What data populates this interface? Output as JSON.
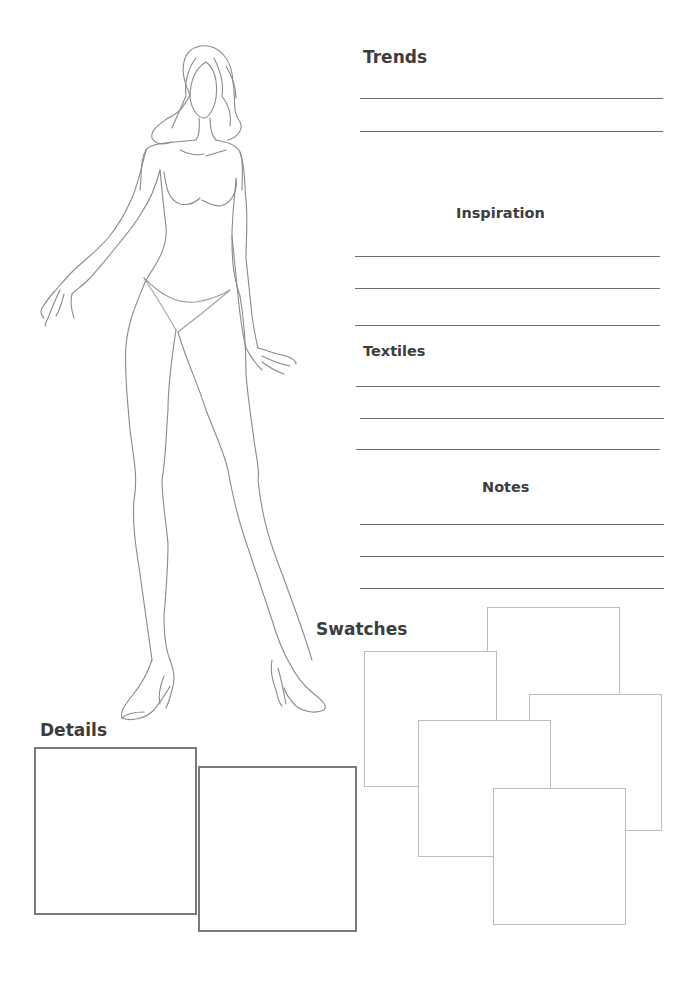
{
  "page": {
    "type": "fashion design sketch worksheet",
    "background": "#ffffff"
  },
  "figure": {
    "label": "fashion croquis figure outline",
    "stroke_color": "#8a8a8c"
  },
  "sections": {
    "trends": {
      "title": "Trends",
      "line_count": 2
    },
    "inspiration": {
      "title": "Inspiration",
      "line_count": 3
    },
    "textiles": {
      "title": "Textiles",
      "line_count": 3
    },
    "notes": {
      "title": "Notes",
      "line_count": 3
    },
    "swatches": {
      "title": "Swatches",
      "box_count": 5
    },
    "details": {
      "title": "Details",
      "box_count": 2
    }
  },
  "colors": {
    "heading": "#3d3d40",
    "rule": "#6e6e70",
    "swatch_border": "#bdbdbf",
    "detail_border": "#7a7a7c"
  }
}
